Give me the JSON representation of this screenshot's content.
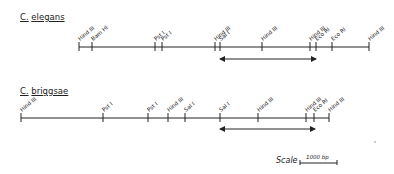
{
  "maps": [
    {
      "species_genus": "C.",
      "species_name": "elegans",
      "line_y": 47,
      "line_start": 79,
      "line_end": 369,
      "sites": [
        {
          "label": "Hind III",
          "x": 79
        },
        {
          "label": "Bam HI",
          "x": 92
        },
        {
          "label": "Pst I",
          "x": 155
        },
        {
          "label": "Pst I",
          "x": 162
        },
        {
          "label": "Hind III",
          "x": 215
        },
        {
          "label": "Sal I",
          "x": 220
        },
        {
          "label": "Hind III",
          "x": 262
        },
        {
          "label": "Hind III",
          "x": 310
        },
        {
          "label": "Eco RI",
          "x": 316
        },
        {
          "label": "Eco RI",
          "x": 332
        },
        {
          "label": "Hind III",
          "x": 369
        }
      ],
      "arrow": {
        "y": 59,
        "x1": 220,
        "x2": 316
      }
    },
    {
      "species_genus": "C.",
      "species_name": "briggsae",
      "line_y": 118,
      "line_start": 21,
      "line_end": 329,
      "sites": [
        {
          "label": "Hind III",
          "x": 21
        },
        {
          "label": "Pst I",
          "x": 103
        },
        {
          "label": "Pst I",
          "x": 148
        },
        {
          "label": "Hind III",
          "x": 168
        },
        {
          "label": "Sal I",
          "x": 185
        },
        {
          "label": "Sal I",
          "x": 220
        },
        {
          "label": "Hind III",
          "x": 258
        },
        {
          "label": "Hind III",
          "x": 306
        },
        {
          "label": "Eco RI",
          "x": 314
        },
        {
          "label": "Hind III",
          "x": 329
        }
      ],
      "arrow": {
        "y": 129,
        "x1": 220,
        "x2": 315
      }
    }
  ],
  "scale": {
    "label": "Scale",
    "value": "1000 bp",
    "x1": 300,
    "x2": 337,
    "y": 163
  }
}
